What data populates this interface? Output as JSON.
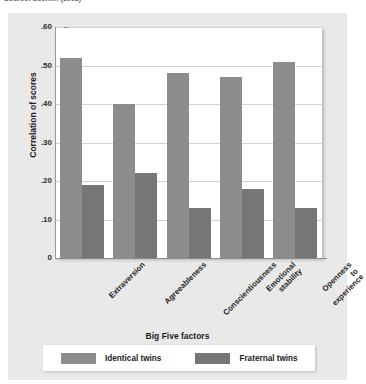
{
  "source_note": "Source: Loehlin (1992)",
  "chart_data": {
    "type": "bar",
    "title": "",
    "xlabel": "Big Five factors",
    "ylabel": "Correlation of scores",
    "ylim": [
      0,
      0.6
    ],
    "ytick_labels": [
      ".60",
      ".50",
      ".40",
      ".30",
      ".20",
      ".10",
      "0"
    ],
    "ytick_values": [
      0.6,
      0.5,
      0.4,
      0.3,
      0.2,
      0.1,
      0
    ],
    "grid": true,
    "legend_position": "bottom",
    "categories": [
      "Extraversion",
      "Agreeableness",
      "Conscientiousness",
      "Emotional stability",
      "Openness to experience"
    ],
    "category_lines": [
      [
        "Extraversion"
      ],
      [
        "Agreeableness"
      ],
      [
        "Conscientiousness"
      ],
      [
        "Emotional",
        "stability"
      ],
      [
        "Openness",
        "to",
        "experience"
      ]
    ],
    "series": [
      {
        "name": "Identical twins",
        "color": "#8d8d8d",
        "values": [
          0.52,
          0.4,
          0.48,
          0.47,
          0.51
        ]
      },
      {
        "name": "Fraternal twins",
        "color": "#767676",
        "values": [
          0.19,
          0.22,
          0.13,
          0.18,
          0.13
        ]
      }
    ]
  },
  "legend": {
    "items": [
      {
        "label": "Identical twins",
        "color": "#8d8d8d"
      },
      {
        "label": "Fraternal twins",
        "color": "#767676"
      }
    ]
  }
}
